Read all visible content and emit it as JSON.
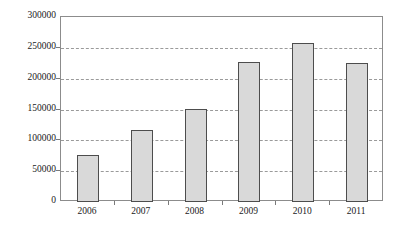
{
  "chart_data": {
    "type": "bar",
    "title": "",
    "subtitle": "",
    "xlabel": "",
    "ylabel": "",
    "categories": [
      "2006",
      "2007",
      "2008",
      "2009",
      "2010",
      "2011"
    ],
    "values": [
      76000,
      116000,
      151000,
      227000,
      258000,
      225000
    ],
    "series": [
      {
        "name": "",
        "values": [
          76000,
          116000,
          151000,
          227000,
          258000,
          225000
        ]
      }
    ],
    "ylim": [
      0,
      300000
    ],
    "yticks": [
      0,
      50000,
      100000,
      150000,
      200000,
      250000,
      300000
    ],
    "ytick_labels": [
      "0",
      "50000",
      "100000",
      "150000",
      "200000",
      "250000",
      "300000"
    ],
    "grid": true,
    "grid_axis": "y",
    "grid_style": "dashed",
    "legend": false,
    "legend_position": "none",
    "annotations": [],
    "colors": {
      "bar_fill": "#d9d9d9",
      "bar_border": "#4d4d4d",
      "gridline": "#9a9a9a",
      "frame": "#8c8c8c",
      "text": "#1a1a1a",
      "background": "#ffffff"
    }
  }
}
